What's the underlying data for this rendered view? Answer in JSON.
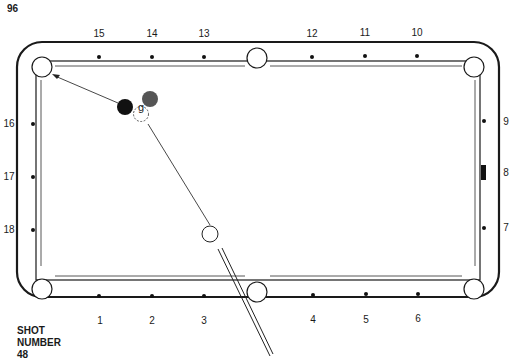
{
  "page": {
    "number": "96"
  },
  "shot": {
    "label_line1": "SHOT",
    "label_line2": "NUMBER",
    "number": "48"
  },
  "table": {
    "top_diamonds": [
      "15",
      "14",
      "13",
      "12",
      "11",
      "10"
    ],
    "bottom_diamonds": [
      "1",
      "2",
      "3",
      "4",
      "5",
      "6"
    ],
    "left_diamonds": [
      "16",
      "17",
      "18"
    ],
    "right_diamonds": [
      "9",
      "8",
      "7"
    ]
  },
  "balls": {
    "ghost_ball_label": "g",
    "object_ball_1_color": "#111111",
    "object_ball_2_color": "#555555",
    "cue_ball_color": "#ffffff"
  }
}
